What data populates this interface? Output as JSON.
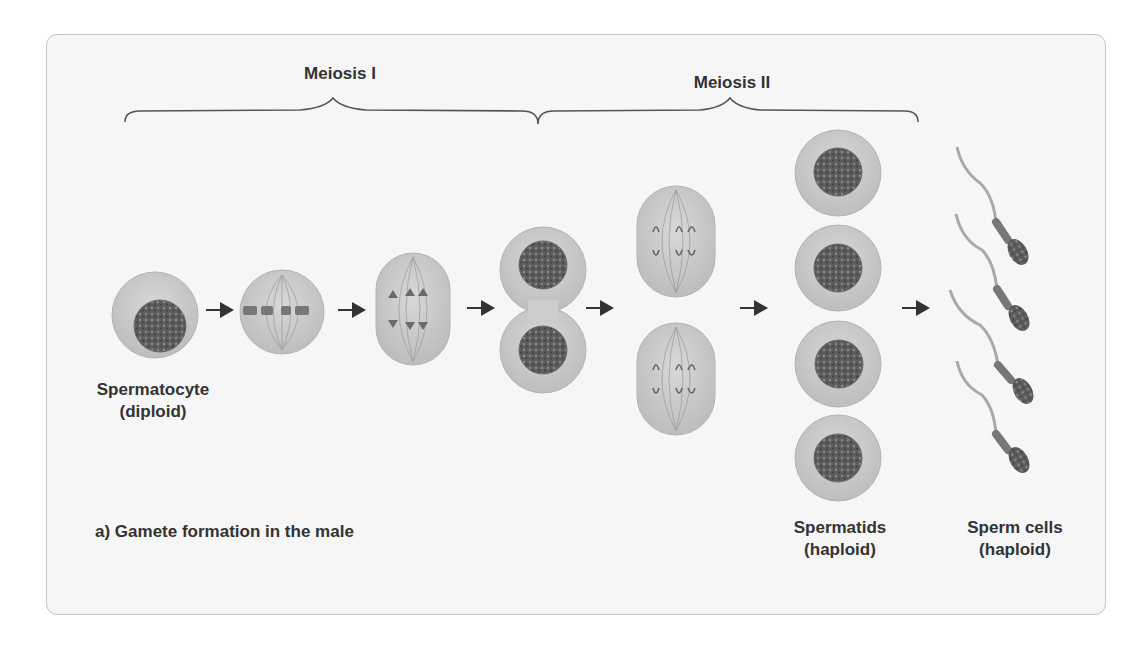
{
  "diagram": {
    "caption": "a) Gamete formation in the male",
    "phases": [
      {
        "label": "Meiosis I"
      },
      {
        "label": "Meiosis II"
      }
    ],
    "stages": [
      {
        "name": "Spermatocyte",
        "ploidy": "(diploid)"
      },
      {
        "name": "Spermatids",
        "ploidy": "(haploid)"
      },
      {
        "name": "Sperm cells",
        "ploidy": "(haploid)"
      }
    ],
    "colors": {
      "panel_bg": "#f6f6f6",
      "panel_border": "#c4c4c4",
      "cell": "#c9c9c9",
      "cell_edge": "#b0b0b0",
      "nucleus": "#5a5a5a",
      "text": "#333333",
      "arrow": "#333333"
    }
  }
}
